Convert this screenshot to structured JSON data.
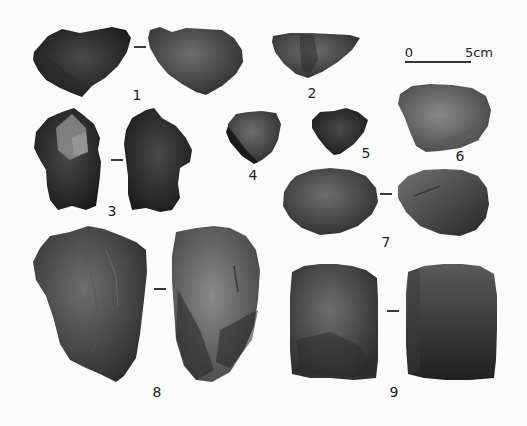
{
  "figure": {
    "type": "lithic-artifact-plate",
    "background": "#fbfbfb",
    "scale_bar": {
      "start_label": "0",
      "end_label": "5cm",
      "x1": 405,
      "x2": 470,
      "y": 61
    },
    "artifacts": [
      {
        "id": "1",
        "label": "1",
        "label_pos": [
          137,
          95
        ],
        "views": 2,
        "dash_pos": [
          140,
          47
        ]
      },
      {
        "id": "2",
        "label": "2",
        "label_pos": [
          312,
          93
        ],
        "views": 1
      },
      {
        "id": "3",
        "label": "3",
        "label_pos": [
          112,
          211
        ],
        "views": 2,
        "dash_pos": [
          117,
          160
        ]
      },
      {
        "id": "4",
        "label": "4",
        "label_pos": [
          253,
          175
        ],
        "views": 1
      },
      {
        "id": "5",
        "label": "5",
        "label_pos": [
          366,
          153
        ],
        "views": 1
      },
      {
        "id": "6",
        "label": "6",
        "label_pos": [
          460,
          156
        ],
        "views": 1
      },
      {
        "id": "7",
        "label": "7",
        "label_pos": [
          386,
          242
        ],
        "views": 2,
        "dash_pos": [
          386,
          194
        ]
      },
      {
        "id": "8",
        "label": "8",
        "label_pos": [
          157,
          392
        ],
        "views": 2,
        "dash_pos": [
          160,
          289
        ]
      },
      {
        "id": "9",
        "label": "9",
        "label_pos": [
          394,
          392
        ],
        "views": 2,
        "dash_pos": [
          393,
          311
        ]
      }
    ]
  }
}
